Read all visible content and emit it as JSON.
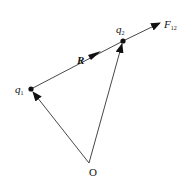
{
  "diagram": {
    "title": "",
    "labels": {
      "q1": "q",
      "q1_sub": "1",
      "q2": "q",
      "q2_sub": "2",
      "R": "R",
      "F12": "F",
      "F12_sub": "12",
      "origin": "O"
    },
    "points": {
      "origin": [
        89,
        163
      ],
      "q1": [
        31,
        89
      ],
      "q2": [
        123,
        41
      ],
      "F12_tip": [
        160,
        23
      ]
    },
    "vectors": [
      {
        "name": "position-q1",
        "from": "origin",
        "to": "q1"
      },
      {
        "name": "position-q2",
        "from": "origin",
        "to": "q2"
      },
      {
        "name": "R",
        "from": "q1",
        "to": "q2"
      },
      {
        "name": "F12",
        "from": "q2",
        "to": "F12_tip"
      }
    ],
    "colors": {
      "line": "#333333",
      "text": "#111111",
      "background": "#ffffff"
    }
  }
}
